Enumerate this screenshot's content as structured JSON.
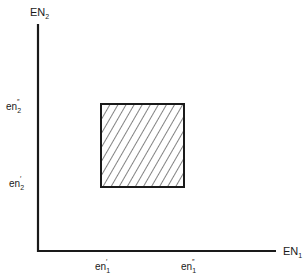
{
  "diagram": {
    "type": "region-in-2d-space",
    "x_axis": {
      "base": "EN",
      "subscript": "1",
      "ticks": [
        {
          "base": "en",
          "subscript": "1",
          "prime": "′"
        },
        {
          "base": "en",
          "subscript": "1",
          "prime": "″"
        }
      ]
    },
    "y_axis": {
      "base": "EN",
      "subscript": "2",
      "ticks": [
        {
          "base": "en",
          "subscript": "2",
          "prime": "″"
        },
        {
          "base": "en",
          "subscript": "2",
          "prime": "′"
        }
      ]
    },
    "region": {
      "description": "hatched rectangle bounded by en1′–en1″ and en2′–en2″",
      "fill_pattern": "diagonal-hatch",
      "stroke_color": "#1a1a1a"
    },
    "colors": {
      "background": "#ffffff",
      "ink": "#1a1a1a"
    }
  }
}
